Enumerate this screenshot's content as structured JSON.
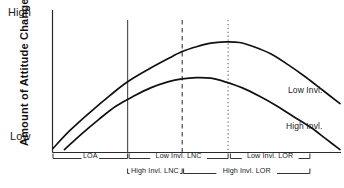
{
  "chart_data": {
    "type": "line",
    "title": "",
    "xlabel": "",
    "ylabel": "Amount of Attitude Change",
    "y_tick_labels": [
      "Low",
      "High"
    ],
    "ylim": [
      0,
      1
    ],
    "grid": false,
    "legend_position": "inline-right",
    "series": [
      {
        "name": "Low Invl.",
        "label": "Low Invl.",
        "style": "solid",
        "points": [
          [
            0.0,
            0.03
          ],
          [
            0.06,
            0.18
          ],
          [
            0.13,
            0.33
          ],
          [
            0.2,
            0.47
          ],
          [
            0.26,
            0.58
          ],
          [
            0.33,
            0.68
          ],
          [
            0.4,
            0.77
          ],
          [
            0.45,
            0.83
          ],
          [
            0.5,
            0.87
          ],
          [
            0.55,
            0.9
          ],
          [
            0.6,
            0.91
          ],
          [
            0.65,
            0.905
          ],
          [
            0.7,
            0.87
          ],
          [
            0.76,
            0.81
          ],
          [
            0.82,
            0.72
          ],
          [
            0.88,
            0.62
          ],
          [
            0.94,
            0.51
          ],
          [
            1.0,
            0.4
          ]
        ]
      },
      {
        "name": "High Invl.",
        "label": "High Invl.",
        "style": "solid",
        "points": [
          [
            0.04,
            0.02
          ],
          [
            0.1,
            0.15
          ],
          [
            0.16,
            0.27
          ],
          [
            0.22,
            0.38
          ],
          [
            0.28,
            0.46
          ],
          [
            0.34,
            0.53
          ],
          [
            0.4,
            0.58
          ],
          [
            0.45,
            0.605
          ],
          [
            0.5,
            0.615
          ],
          [
            0.55,
            0.61
          ],
          [
            0.6,
            0.58
          ],
          [
            0.66,
            0.53
          ],
          [
            0.72,
            0.46
          ],
          [
            0.78,
            0.38
          ],
          [
            0.84,
            0.29
          ],
          [
            0.9,
            0.2
          ],
          [
            0.95,
            0.11
          ],
          [
            1.0,
            0.02
          ]
        ]
      }
    ],
    "reference_lines": [
      {
        "name": "loa-boundary",
        "x": 0.26,
        "style": "solid"
      },
      {
        "name": "low-invl-peak",
        "x": 0.45,
        "style": "dashed"
      },
      {
        "name": "lor-boundary",
        "x": 0.61,
        "style": "dotted"
      }
    ],
    "annotations": [
      {
        "name": "loa",
        "label": "LOA",
        "row": 1,
        "x_start": 0.0,
        "x_end": 0.26
      },
      {
        "name": "low-invl-lnc",
        "label": "Low Invl. LNC",
        "row": 1,
        "x_start": 0.265,
        "x_end": 0.61
      },
      {
        "name": "low-invl-lor",
        "label": "Low Invl. LOR",
        "row": 1,
        "x_start": 0.618,
        "x_end": 0.895
      },
      {
        "name": "high-invl-lnc",
        "label": "High Invl. LNC",
        "row": 2,
        "x_start": 0.26,
        "x_end": 0.45
      },
      {
        "name": "high-invl-lor",
        "label": "High Invl. LOR",
        "row": 2,
        "x_start": 0.455,
        "x_end": 0.895
      }
    ]
  },
  "axis": {
    "y_high_label": "High",
    "y_low_label": "Low",
    "y_title": "Amount of Attitude Change"
  },
  "curve_labels": {
    "low": "Low Invl.",
    "high": "High Invl."
  },
  "brackets": {
    "loa": "LOA",
    "low_invl_lnc": "Low Invl. LNC",
    "low_invl_lor": "Low Invl. LOR",
    "high_invl_lnc": "High Invl. LNC",
    "high_invl_lor": "High Invl. LOR"
  },
  "colors": {
    "ink": "#1a1a1a",
    "axis": "#2b2b2b",
    "curve": "#1a1a1a",
    "reference": "#4a4a4a",
    "background": "#ffffff"
  }
}
